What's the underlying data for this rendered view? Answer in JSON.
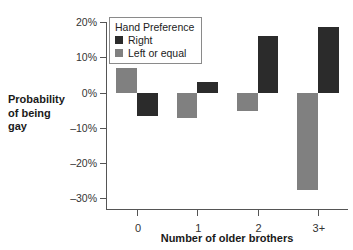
{
  "chart_data": {
    "type": "bar",
    "title": "",
    "xlabel": "Number of older brothers",
    "ylabel_lines": [
      "Probability",
      "of being",
      "gay"
    ],
    "categories": [
      "0",
      "1",
      "2",
      "3+"
    ],
    "ytick_labels": [
      "20%",
      "10%",
      "0%",
      "–10%",
      "–20%",
      "–30%"
    ],
    "ytick_values": [
      20,
      10,
      0,
      -10,
      -20,
      -30
    ],
    "ylim": [
      -33,
      20
    ],
    "grid": false,
    "legend_position": "top-left-inside",
    "legend_title": "Hand Preference",
    "series": [
      {
        "name": "Right",
        "color": "#2b2b2b",
        "values": [
          -6.7,
          3.1,
          16.1,
          18.5
        ]
      },
      {
        "name": "Left or equal",
        "color": "#808080",
        "values": [
          7.0,
          -7.2,
          -5.2,
          -27.5
        ]
      }
    ],
    "series_order_in_group": [
      "Left or equal",
      "Right"
    ]
  }
}
